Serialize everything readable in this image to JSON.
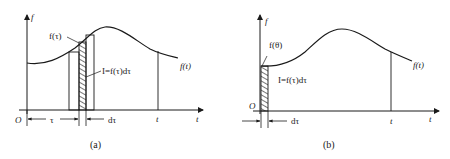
{
  "panels": [
    {
      "id": "a",
      "caption": "(a)",
      "y_axis_label": "f",
      "x_axis_label": "t",
      "origin_label": "O",
      "curve_label": "f(t)",
      "point_label": "f(τ)",
      "area_label": "I=f(τ)dτ",
      "tau_label": "τ",
      "dtau_label": "dτ",
      "t_marker_label": "t"
    },
    {
      "id": "b",
      "caption": "(b)",
      "y_axis_label": "f",
      "x_axis_label": "t",
      "origin_label": "O",
      "curve_label": "f(t)",
      "point_label": "f(θ)",
      "area_label": "I=f(τ)dτ",
      "dtau_label": "dτ",
      "t_marker_label": "t"
    }
  ],
  "colors": {
    "line": "#1a1a1a",
    "background": "#ffffff"
  }
}
